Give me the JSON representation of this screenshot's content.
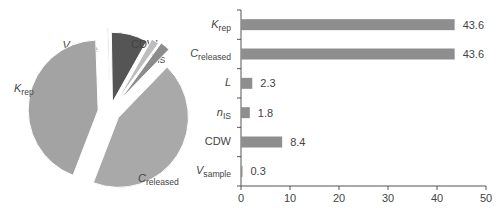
{
  "chart_data": [
    {
      "type": "pie",
      "title": "",
      "slices": [
        {
          "label": "V",
          "sub": "sample",
          "italic": true,
          "value": 0.3,
          "color": "#8a8a8a"
        },
        {
          "label": "CDW",
          "sub": "",
          "italic": false,
          "value": 8.4,
          "color": "#555555"
        },
        {
          "label": "n",
          "sub": "IS",
          "italic": true,
          "value": 1.8,
          "color": "#bdbdbd"
        },
        {
          "label": "L",
          "sub": "",
          "italic": true,
          "value": 2.3,
          "color": "#8c8c8c"
        },
        {
          "label": "C",
          "sub": "released",
          "italic": true,
          "value": 43.6,
          "color": "#a9a9a9"
        },
        {
          "label": "K",
          "sub": "rep",
          "italic": true,
          "value": 43.6,
          "color": "#a3a3a3"
        }
      ],
      "exploded": true
    },
    {
      "type": "bar",
      "orientation": "horizontal",
      "title": "",
      "xlabel": "",
      "ylabel": "",
      "categories": [
        "Krep",
        "Creleased",
        "L",
        "nIS",
        "CDW",
        "Vsample"
      ],
      "category_labels": [
        {
          "label": "K",
          "sub": "rep",
          "italic": true
        },
        {
          "label": "C",
          "sub": "released",
          "italic": true
        },
        {
          "label": "L",
          "sub": "",
          "italic": true
        },
        {
          "label": "n",
          "sub": "IS",
          "italic": true
        },
        {
          "label": "CDW",
          "sub": "",
          "italic": false
        },
        {
          "label": "V",
          "sub": "sample",
          "italic": true
        }
      ],
      "values": [
        43.6,
        43.6,
        2.3,
        1.8,
        8.4,
        0.3
      ],
      "value_labels": [
        "43.6",
        "43.6",
        "2.3",
        "1.8",
        "8.4",
        "0.3"
      ],
      "xlim": [
        0,
        50
      ],
      "xticks": [
        0,
        10,
        20,
        30,
        40,
        50
      ],
      "grid": false,
      "bar_color": "#8e8e8e",
      "legend": null
    }
  ]
}
